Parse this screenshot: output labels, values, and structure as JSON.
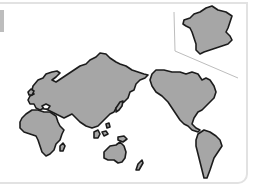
{
  "map": {
    "projection": "pacific-centered",
    "colors": {
      "land_fill": "#a6a6a6",
      "land_stroke": "#1c1c1c",
      "card_border": "#e2e2e2",
      "inset_frame": "#bdbdbd",
      "background": "#ffffff",
      "edge_tab": "#bdbdbd"
    },
    "regions": [
      {
        "name": "eurasia"
      },
      {
        "name": "africa"
      },
      {
        "name": "north-america"
      },
      {
        "name": "south-america"
      },
      {
        "name": "australia"
      },
      {
        "name": "japan"
      },
      {
        "name": "southeast-asia-islands"
      },
      {
        "name": "new-zealand"
      },
      {
        "name": "madagascar"
      },
      {
        "name": "british-isles"
      }
    ],
    "inset": {
      "name": "france",
      "position": "top-right"
    }
  }
}
